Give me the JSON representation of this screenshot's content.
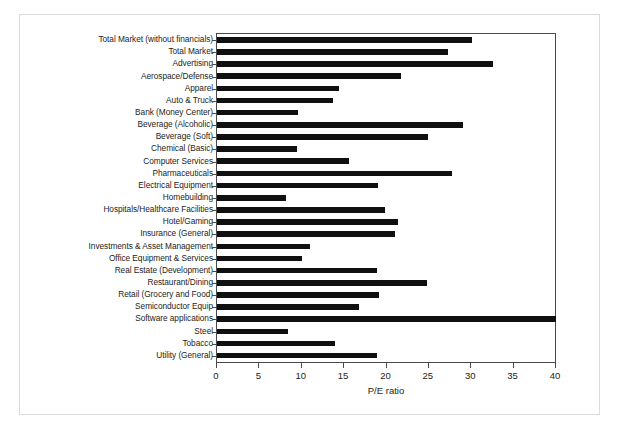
{
  "chart_data": {
    "type": "bar",
    "orientation": "horizontal",
    "title": "",
    "xlabel": "P/E ratio",
    "ylabel": "",
    "xlim": [
      0,
      40
    ],
    "xticks": [
      0,
      5,
      10,
      15,
      20,
      25,
      30,
      35,
      40
    ],
    "grid": false,
    "legend": null,
    "bar_color": "#101010",
    "frame_color": "#4a4a4a",
    "categories": [
      "Total Market (without financials)",
      "Total Market",
      "Advertising",
      "Aerospace/Defense",
      "Apparel",
      "Auto & Truck",
      "Bank (Money Center)",
      "Beverage (Alcoholic)",
      "Beverage (Soft)",
      "Chemical (Basic)",
      "Computer Services",
      "Pharmaceuticals",
      "Electrical Equipment",
      "Homebuilding",
      "Hospitals/Healthcare Facilities",
      "Hotel/Gaming",
      "Insurance (General)",
      "Investments & Asset Management",
      "Office Equipment & Services",
      "Real Estate (Development)",
      "Restaurant/Dining",
      "Retail (Grocery and Food)",
      "Semiconductor Equip",
      "Software applications",
      "Steel",
      "Tobacco",
      "Utility (General)"
    ],
    "values": [
      30.1,
      27.3,
      32.6,
      21.7,
      14.4,
      13.7,
      9.6,
      29.0,
      24.9,
      9.4,
      15.6,
      27.7,
      19.0,
      8.1,
      19.8,
      21.3,
      21.0,
      11.0,
      10.0,
      18.9,
      24.8,
      19.1,
      16.8,
      40.0,
      8.4,
      13.9,
      18.9
    ]
  }
}
